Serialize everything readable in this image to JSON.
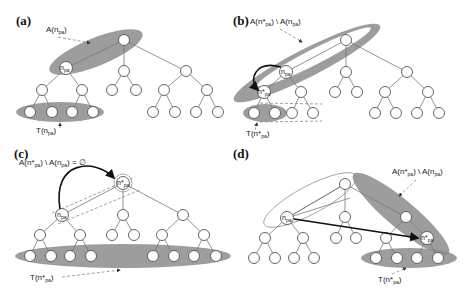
{
  "figure": {
    "panels": [
      {
        "id": "a",
        "label": "(a)",
        "ancestor_label": "A(n",
        "ancestor_sub": "pa",
        "ancestor_close": ")",
        "node_label": "n",
        "node_sub": "pa",
        "subtree_label": "T(n",
        "subtree_sub": "pa",
        "subtree_close": ")"
      },
      {
        "id": "b",
        "label": "(b)",
        "ancestor_label": "A(n*",
        "ancestor_sub": "pa",
        "ancestor_mid": ") \\ A(n",
        "ancestor_sub2": "pa",
        "ancestor_close": ")",
        "node_label": "n",
        "node_sub": "pa",
        "star_node_label": "n*",
        "star_node_sub": "pa",
        "subtree_label": "T(n*",
        "subtree_sub": "pa",
        "subtree_close": ")"
      },
      {
        "id": "c",
        "label": "(c)",
        "ancestor_label": "A(n*",
        "ancestor_sub": "pa",
        "ancestor_mid": ") \\ A(n",
        "ancestor_sub2": "pa",
        "ancestor_close": ") = ∅",
        "node_label": "n",
        "node_sub": "pa",
        "star_node_label": "n*",
        "star_node_sub": "pa",
        "subtree_label": "T(n*",
        "subtree_sub": "pa",
        "subtree_close": ")"
      },
      {
        "id": "d",
        "label": "(d)",
        "ancestor_label": "A(n*",
        "ancestor_sub": "pa",
        "ancestor_mid": ") \\ A(n",
        "ancestor_sub2": "pa",
        "ancestor_close": ")",
        "node_label": "n",
        "node_sub": "pa",
        "star_node_label": "n*",
        "star_node_sub": "pa",
        "subtree_label": "T(n*",
        "subtree_sub": "pa",
        "subtree_close": ")"
      }
    ],
    "colors": {
      "shade": "#8c8c8c",
      "node_stroke": "#555555",
      "edge": "#777777",
      "arrow": "#111111"
    }
  }
}
